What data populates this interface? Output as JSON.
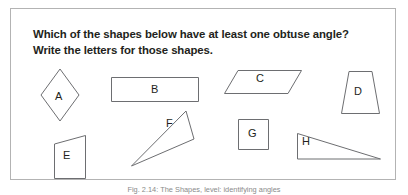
{
  "figure": {
    "prompt_line_1": "Which of the shapes below have at least one obtuse angle?",
    "prompt_line_2": "Write the letters for those shapes.",
    "caption": "Fig. 2.14: The Shapes, level: identifying angles",
    "border_color": "#b3b3b3",
    "shape_stroke_color": "#6d6e71",
    "text_color": "#231f20",
    "background_color": "#ffffff"
  },
  "shapes": [
    {
      "id": "shape-a",
      "label": "A",
      "type": "rhombus",
      "points": "19,0 38,26 19,52 0,26",
      "left": 30,
      "top": 60,
      "width": 38,
      "height": 52,
      "label_left": 44,
      "label_top": 82
    },
    {
      "id": "shape-b",
      "label": "B",
      "type": "rectangle",
      "points": "0,0 88,0 88,25 0,25",
      "left": 100,
      "top": 68,
      "width": 88,
      "height": 25,
      "label_left": 140,
      "label_top": 76
    },
    {
      "id": "shape-c",
      "label": "C",
      "type": "parallelogram",
      "points": "14,0 78,0 64,24 0,24",
      "left": 213,
      "top": 61,
      "width": 78,
      "height": 24,
      "label_left": 245,
      "label_top": 67
    },
    {
      "id": "shape-d",
      "label": "D",
      "type": "trapezoid",
      "points": "8,0 31,0 39,43 0,43",
      "left": 330,
      "top": 62,
      "width": 39,
      "height": 43,
      "label_left": 343,
      "label_top": 79
    },
    {
      "id": "shape-e",
      "label": "E",
      "type": "quadrilateral",
      "points": "0,8 32,0 32,44 0,44",
      "left": 43,
      "top": 126,
      "width": 32,
      "height": 44,
      "label_left": 53,
      "label_top": 142
    },
    {
      "id": "shape-f",
      "label": "F",
      "type": "triangle",
      "points": "55,3 63,30 0,57",
      "left": 120,
      "top": 100,
      "width": 63,
      "height": 57,
      "label_left": 156,
      "label_top": 110
    },
    {
      "id": "shape-g",
      "label": "G",
      "type": "square",
      "points": "0,0 31,0 31,31 0,31",
      "left": 227,
      "top": 110,
      "width": 31,
      "height": 31,
      "label_left": 237,
      "label_top": 120
    },
    {
      "id": "shape-h",
      "label": "H",
      "type": "triangle",
      "points": "0,0 83,26 0,26",
      "left": 286,
      "top": 124,
      "width": 83,
      "height": 26,
      "label_left": 291,
      "label_top": 128
    }
  ]
}
